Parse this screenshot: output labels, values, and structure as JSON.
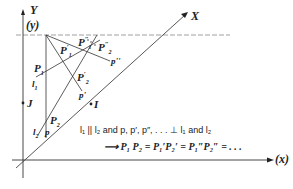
{
  "diagram": {
    "axes": {
      "y_label": "Y",
      "y_paren_label": "(y)",
      "x_diag_label": "X",
      "x_label": "(x)"
    },
    "points": {
      "P1": "P",
      "P1_prime": "P",
      "P1_dprime": "P",
      "P2": "P",
      "P2_prime": "P",
      "P2_dprime": "P",
      "I": "I",
      "J": "J"
    },
    "lines": {
      "l1": "l",
      "l2": "l",
      "p": "p",
      "p_prime": "p'",
      "p_dprime": "p''"
    },
    "caption": {
      "line1": "l₁ || l₂ and  p, p′, p″, . . . ⊥ l₁ and  l₂",
      "line2": "⟶ P₁ P₂ = P₁′P₂′ = P₁″P₂″ = . . ."
    },
    "colors": {
      "ink": "#222222",
      "grid_dash": "#888888",
      "background": "#ffffff"
    }
  }
}
